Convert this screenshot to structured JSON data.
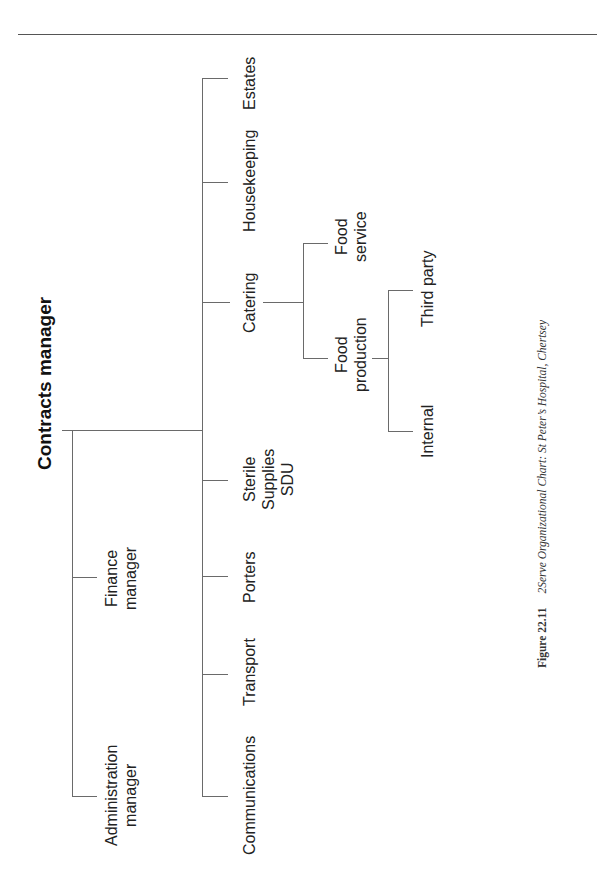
{
  "page": {
    "header_rule": true
  },
  "chart": {
    "root": {
      "label": "Contracts manager"
    },
    "level1": [
      {
        "label_lines": [
          "Administration",
          "manager"
        ]
      },
      {
        "label_lines": [
          "Finance",
          "manager"
        ]
      }
    ],
    "departments": [
      {
        "label_lines": [
          "Communications"
        ]
      },
      {
        "label_lines": [
          "Transport"
        ]
      },
      {
        "label_lines": [
          "Porters"
        ]
      },
      {
        "label_lines": [
          "Sterile",
          "Supplies",
          "SDU"
        ]
      },
      {
        "label_lines": [
          "Catering"
        ]
      },
      {
        "label_lines": [
          "Housekeeping"
        ]
      },
      {
        "label_lines": [
          "Estates"
        ]
      }
    ],
    "catering_children": [
      {
        "label_lines": [
          "Food",
          "production"
        ]
      },
      {
        "label_lines": [
          "Food",
          "service"
        ]
      }
    ],
    "food_production_children": [
      {
        "label_lines": [
          "Internal"
        ]
      },
      {
        "label_lines": [
          "Third party"
        ]
      }
    ]
  },
  "caption": {
    "figure_label": "Figure 22.11",
    "text": "2Serve Organizational Chart: St Peter’s Hospital, Chertsey"
  }
}
